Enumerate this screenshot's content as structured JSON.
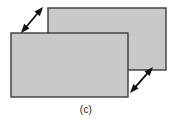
{
  "figure": {
    "caption": "(c)",
    "background_color": "#ffffff",
    "description_label": "two-overlapping-plates-with-shear-arrows",
    "shapes": {
      "back_plate": {
        "name": "back-plate",
        "x": 48,
        "y": 8,
        "width": 118,
        "height": 62,
        "fill": "#c9c9c9",
        "stroke": "#3b3b3b",
        "stroke_width": 1.4
      },
      "front_plate": {
        "name": "front-plate",
        "x": 11,
        "y": 33,
        "width": 117,
        "height": 64,
        "fill": "#c9c9c9",
        "stroke": "#3b3b3b",
        "stroke_width": 1.4
      }
    },
    "arrows": [
      {
        "name": "upper-left-shear-arrow",
        "x1": 21,
        "y1": 33,
        "x2": 43,
        "y2": 7,
        "double_headed": true,
        "color": "#111111",
        "shaft_width": 1.8,
        "head_length": 9,
        "head_width": 7
      },
      {
        "name": "lower-right-shear-arrow",
        "x1": 130,
        "y1": 93,
        "x2": 153,
        "y2": 67,
        "double_headed": true,
        "color": "#111111",
        "shaft_width": 1.8,
        "head_length": 9,
        "head_width": 7
      }
    ]
  }
}
